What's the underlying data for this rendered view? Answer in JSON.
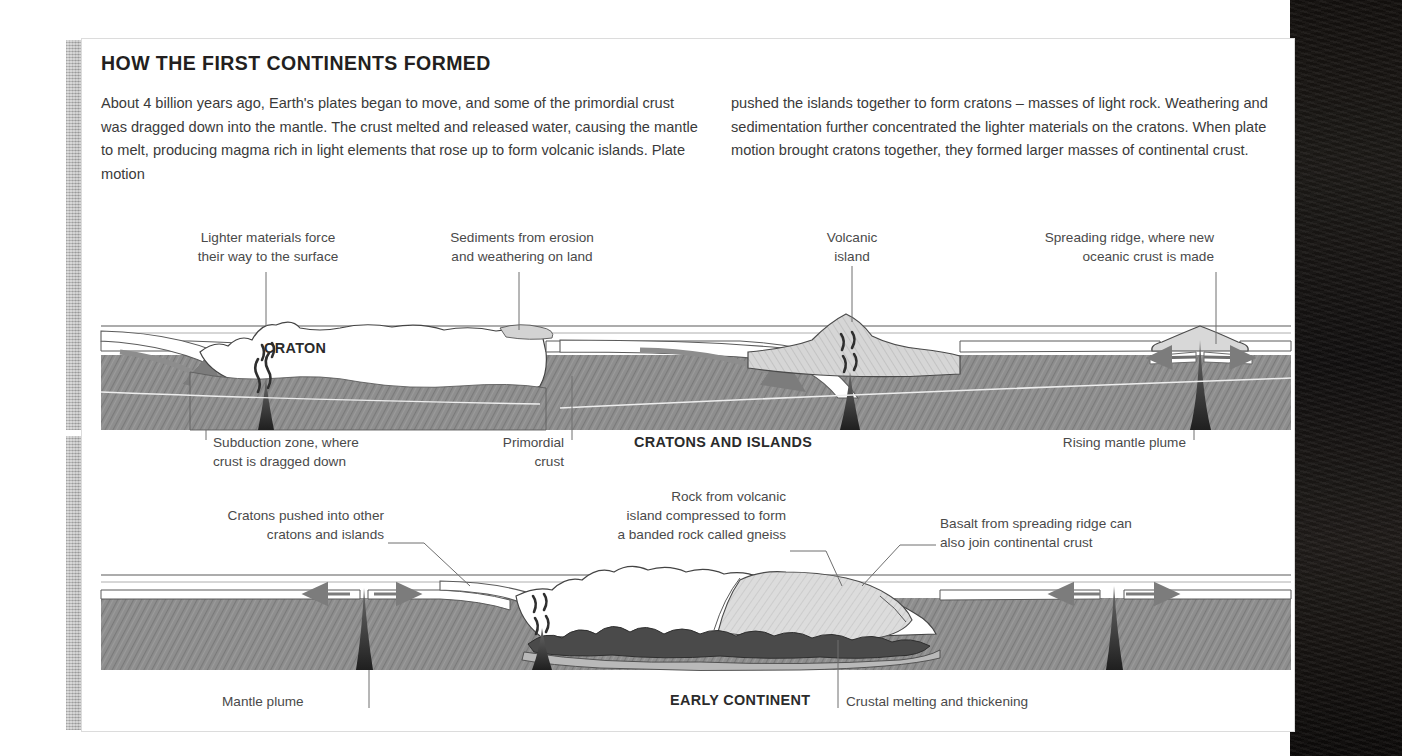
{
  "heading": "HOW THE FIRST CONTINENTS FORMED",
  "intro": {
    "left": "About 4 billion years ago, Earth's plates began to move, and some of the primordial crust was dragged down into the mantle. The crust melted and released water, causing the mantle to melt, producing magma rich in light elements that rose up to form volcanic islands. Plate motion",
    "right": "pushed the islands together to form cratons – masses of light rock. Weathering and sedimentation further concentrated the lighter materials on the cratons. When plate motion brought cratons together, they formed larger masses of continental crust."
  },
  "panel_top": {
    "caption": "CRATONS AND ISLANDS",
    "inline_label": "CRATON",
    "labels": {
      "lighter_materials": "Lighter materials force\ntheir way to the surface",
      "sediments": "Sediments from erosion\nand weathering on land",
      "volcanic_island": "Volcanic\nisland",
      "spreading_ridge": "Spreading ridge, where new\noceanic crust is made",
      "subduction_zone": "Subduction zone, where\ncrust is dragged down",
      "primordial_crust": "Primordial\ncrust",
      "rising_mantle_plume": "Rising mantle plume"
    }
  },
  "panel_bottom": {
    "caption": "EARLY CONTINENT",
    "labels": {
      "cratons_pushed": "Cratons pushed into other\ncratons and islands",
      "gneiss": "Rock from volcanic\nisland compressed to form\na banded rock called gneiss",
      "basalt": "Basalt from spreading ridge can\nalso join continental crust",
      "mantle_plume": "Mantle plume",
      "crustal_melting": "Crustal melting and thickening"
    }
  },
  "colors": {
    "mantle": "#8e8e8e",
    "crust_white": "#ffffff",
    "island_gray": "#d8d8d8",
    "melt_dark": "#4a4a4a",
    "plume_dark": "#2e2e2e",
    "ink": "#231f20",
    "text": "#3a3a3a",
    "frame": "#dcdcdc",
    "gutter": "#14110f"
  }
}
